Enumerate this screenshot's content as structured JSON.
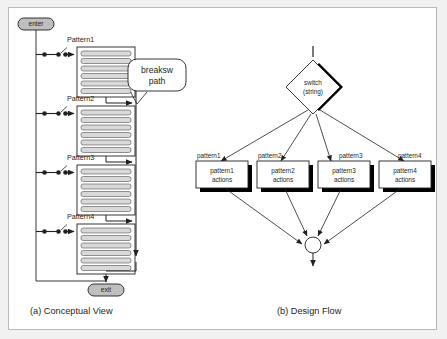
{
  "figure": {
    "background_color": "#f1f1f1",
    "panel_color": "#ffffff",
    "border_color": "#b9b9b9",
    "ink_color": "#231f20",
    "shadow_color": "#000000",
    "pill_fill": "#bfbfbf",
    "bar_fill": "#d9d9d9"
  },
  "captions": {
    "left": "(a) Conceptual View",
    "right": "(b) Design Flow"
  },
  "conceptual_view": {
    "entry_node": "enter",
    "exit_node": "exit",
    "callout": {
      "line1": "breaksw",
      "line2": "path"
    },
    "blocks": [
      {
        "label": "Pattern1",
        "bars": 6
      },
      {
        "label": "Pattern2",
        "bars": 6
      },
      {
        "label": "Pattern3",
        "bars": 6
      },
      {
        "label": "Pattern4",
        "bars": 6
      }
    ]
  },
  "design_flow": {
    "decision": {
      "line1": "switch",
      "line2": "(string)"
    },
    "branches": [
      {
        "case_label": "pattern1",
        "action_line1": "pattern1",
        "action_line2": "actions"
      },
      {
        "case_label": "pattern2",
        "action_line1": "pattern2",
        "action_line2": "actions"
      },
      {
        "case_label": "pattern3",
        "action_line1": "pattern3",
        "action_line2": "actions"
      },
      {
        "case_label": "pattern4",
        "action_line1": "pattern4",
        "action_line2": "actions"
      }
    ],
    "merge_node": "join-circle"
  }
}
